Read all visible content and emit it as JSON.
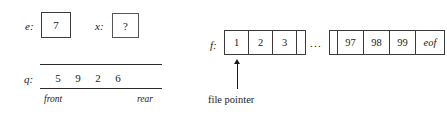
{
  "diagram": {
    "variables": [
      {
        "label": "e:",
        "value": "7",
        "name": "variable-e"
      },
      {
        "label": "x:",
        "value": "?",
        "name": "variable-x"
      }
    ],
    "queue": {
      "label": "q:",
      "values": [
        "5",
        "9",
        "2",
        "6"
      ],
      "front_label": "front",
      "rear_label": "rear"
    },
    "file": {
      "label": "f:",
      "head_cells": [
        "1",
        "2",
        "3"
      ],
      "ellipsis": "...",
      "tail_cells": [
        "97",
        "98",
        "99",
        "eof"
      ],
      "pointer_caption": "file pointer"
    },
    "colors": {
      "ink": "#1a1a1a",
      "rule": "#2b2b2b",
      "box_border": "#3c3c3c",
      "background": "#ffffff"
    }
  }
}
